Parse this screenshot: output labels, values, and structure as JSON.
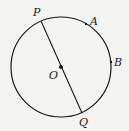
{
  "diagram": {
    "type": "circle-geometry",
    "circle": {
      "center_label": "O",
      "cx": 61,
      "cy": 67,
      "r": 50
    },
    "diameter": {
      "from": "P",
      "to": "Q"
    },
    "points": [
      {
        "label": "P",
        "x": 41,
        "y": 21,
        "lx": 33,
        "ly": 16
      },
      {
        "label": "A",
        "x": 86,
        "y": 24,
        "lx": 90,
        "ly": 25
      },
      {
        "label": "B",
        "x": 111,
        "y": 62,
        "lx": 114,
        "ly": 66
      },
      {
        "label": "O",
        "x": 61,
        "y": 67,
        "lx": 49,
        "ly": 79
      },
      {
        "label": "Q",
        "x": 82,
        "y": 113,
        "lx": 79,
        "ly": 126
      }
    ],
    "colors": {
      "stroke": "#1a1a1a",
      "background": "#f4f4f2"
    }
  }
}
